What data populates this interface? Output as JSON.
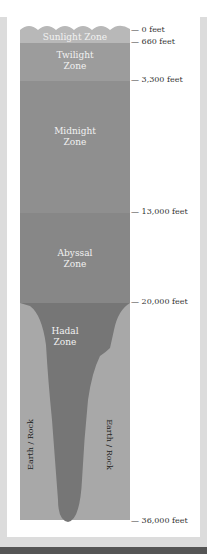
{
  "diagram": {
    "type": "ocean-depth-zones",
    "zones": [
      {
        "name": "Sunlight Zone",
        "lines": [
          "Sunlight Zone"
        ],
        "color": "#b8b8b8"
      },
      {
        "name": "Twilight Zone",
        "lines": [
          "Twilight",
          "Zone"
        ],
        "color": "#9a9a9a"
      },
      {
        "name": "Midnight Zone",
        "lines": [
          "Midnight",
          "Zone"
        ],
        "color": "#8e8e8e"
      },
      {
        "name": "Abyssal Zone",
        "lines": [
          "Abyssal",
          "Zone"
        ],
        "color": "#858585"
      },
      {
        "name": "Hadal Zone",
        "lines": [
          "Hadal",
          "Zone"
        ],
        "color": "#747474"
      }
    ],
    "depth_labels": [
      "— 0 feet",
      "— 660 feet",
      "— 3,300 feet",
      "— 13,000 feet",
      "— 20,000 feet",
      "— 36,000 feet"
    ],
    "rock_labels": [
      "Earth / Rock",
      "Earth / Rock"
    ],
    "rock_color": "#a6a6a6"
  }
}
